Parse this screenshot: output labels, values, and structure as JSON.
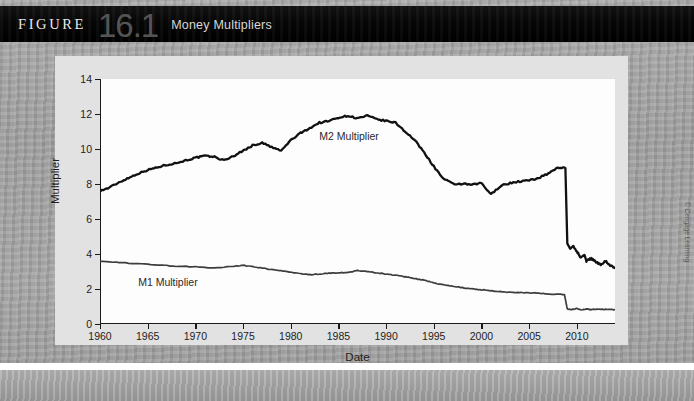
{
  "header": {
    "figure_word": "FIGURE",
    "figure_number": "16.1",
    "figure_title": "Money Multipliers"
  },
  "credit": "© Cengage Learning",
  "chart_data": {
    "type": "line",
    "title": "Money Multipliers",
    "xlabel": "Date",
    "ylabel": "Multiplier",
    "xlim": [
      1960,
      2014
    ],
    "ylim": [
      0,
      14
    ],
    "grid": false,
    "legend_position": "inline-annotation",
    "y_ticks": [
      0,
      2,
      4,
      6,
      8,
      10,
      12,
      14
    ],
    "x_ticks": [
      1960,
      1965,
      1970,
      1975,
      1980,
      1985,
      1990,
      1995,
      2000,
      2005,
      2010
    ],
    "y_tick_labels": [
      "0",
      "2",
      "4",
      "6",
      "8",
      "10",
      "12",
      "14"
    ],
    "x_tick_labels": [
      "1960",
      "1965",
      "1970",
      "1975",
      "1980",
      "1985",
      "1990",
      "1995",
      "2000",
      "2005",
      "2010"
    ],
    "series": [
      {
        "name": "M2 Multiplier",
        "label_x": 1983,
        "label_y": 10.7,
        "color": "#111111",
        "width": 2.3,
        "x": [
          1960,
          1961,
          1962,
          1963,
          1964,
          1965,
          1966,
          1967,
          1968,
          1969,
          1970,
          1971,
          1972,
          1973,
          1974,
          1975,
          1976,
          1977,
          1978,
          1979,
          1980,
          1981,
          1982,
          1983,
          1984,
          1985,
          1986,
          1987,
          1988,
          1989,
          1990,
          1991,
          1992,
          1993,
          1994,
          1995,
          1996,
          1997,
          1998,
          1999,
          2000,
          2001,
          2002,
          2003,
          2004,
          2005,
          2006,
          2007,
          2008,
          2008.8,
          2009,
          2009.3,
          2009.6,
          2010,
          2010.4,
          2010.8,
          2011,
          2011.5,
          2012,
          2012.5,
          2013,
          2013.5,
          2014
        ],
        "values": [
          7.6,
          7.8,
          8.1,
          8.35,
          8.6,
          8.8,
          8.95,
          9.1,
          9.2,
          9.35,
          9.5,
          9.6,
          9.55,
          9.35,
          9.6,
          9.9,
          10.2,
          10.35,
          10.1,
          9.9,
          10.5,
          10.9,
          11.2,
          11.5,
          11.6,
          11.8,
          11.9,
          11.75,
          11.9,
          11.7,
          11.6,
          11.5,
          11.0,
          10.5,
          9.8,
          9.0,
          8.3,
          8.0,
          8.0,
          7.95,
          8.05,
          7.4,
          7.9,
          8.05,
          8.15,
          8.2,
          8.35,
          8.6,
          8.95,
          8.9,
          4.6,
          4.3,
          4.45,
          4.15,
          3.8,
          3.95,
          3.6,
          3.75,
          3.55,
          3.4,
          3.6,
          3.35,
          3.2
        ]
      },
      {
        "name": "M1 Multiplier",
        "label_x": 1964,
        "label_y": 2.35,
        "color": "#3d3d3d",
        "width": 1.7,
        "x": [
          1960,
          1962,
          1964,
          1966,
          1968,
          1970,
          1972,
          1974,
          1975,
          1976,
          1977,
          1978,
          1979,
          1980,
          1981,
          1982,
          1983,
          1984,
          1985,
          1986,
          1987,
          1988,
          1989,
          1990,
          1991,
          1992,
          1993,
          1994,
          1995,
          1996,
          1997,
          1998,
          1999,
          2000,
          2001,
          2002,
          2003,
          2004,
          2005,
          2006,
          2007,
          2008,
          2008.7,
          2009,
          2009.5,
          2010,
          2010.5,
          2011,
          2011.5,
          2012,
          2013,
          2014
        ],
        "values": [
          3.6,
          3.52,
          3.44,
          3.38,
          3.3,
          3.28,
          3.2,
          3.3,
          3.35,
          3.28,
          3.2,
          3.1,
          3.05,
          2.95,
          2.88,
          2.82,
          2.85,
          2.9,
          2.92,
          2.95,
          3.05,
          3.0,
          2.92,
          2.85,
          2.78,
          2.7,
          2.6,
          2.5,
          2.35,
          2.25,
          2.15,
          2.08,
          2.0,
          1.95,
          1.9,
          1.85,
          1.82,
          1.8,
          1.78,
          1.76,
          1.72,
          1.7,
          1.68,
          0.85,
          0.82,
          0.88,
          0.8,
          0.86,
          0.82,
          0.85,
          0.83,
          0.82
        ]
      }
    ]
  }
}
